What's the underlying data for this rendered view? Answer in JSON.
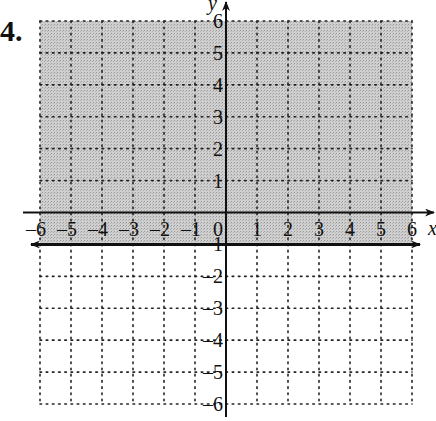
{
  "problem_number": "4.",
  "chart_data": {
    "type": "inequality-graph",
    "title": "",
    "xlabel": "x",
    "ylabel": "y",
    "xlim": [
      -6,
      6
    ],
    "ylim": [
      -6,
      6
    ],
    "x_ticks": [
      -6,
      -5,
      -4,
      -3,
      -2,
      -1,
      0,
      1,
      2,
      3,
      4,
      5,
      6
    ],
    "y_ticks": [
      -6,
      -5,
      -4,
      -3,
      -2,
      -1,
      1,
      2,
      3,
      4,
      5,
      6
    ],
    "grid": "dotted",
    "boundary": {
      "equation": "y = -1",
      "style": "solid",
      "arrows": "both"
    },
    "shaded_region": "y >= -1",
    "inequality": "y ≥ -1",
    "colors": {
      "shade": "#c8c8c8",
      "grid": "#222222",
      "axis": "#111111",
      "background": "#ffffff"
    }
  }
}
